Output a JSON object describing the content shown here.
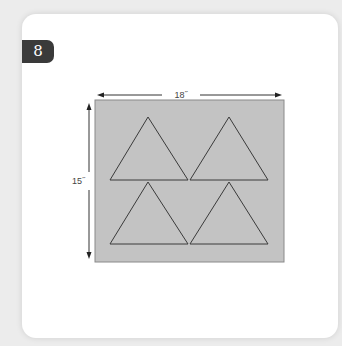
{
  "step_badge": {
    "label": "8"
  },
  "diagram": {
    "width_label": "18˝",
    "height_label": "15˝",
    "fabric_color": "#c3c3c3",
    "line_color": "#3a3a3a",
    "shapes": [
      "triangle",
      "triangle",
      "triangle",
      "triangle"
    ]
  }
}
